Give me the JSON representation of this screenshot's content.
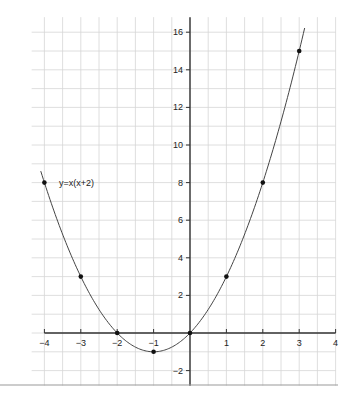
{
  "chart_data": {
    "type": "line",
    "title": "",
    "xlabel": "",
    "ylabel": "",
    "xlim": [
      -4,
      4
    ],
    "ylim": [
      -2.8,
      16.8
    ],
    "grid": true,
    "x_ticks": [
      -4,
      -3,
      -2,
      -1,
      1,
      2,
      3,
      4
    ],
    "x_tick_labels": [
      "−4",
      "−3",
      "−2",
      "−1",
      "1",
      "2",
      "3",
      "4"
    ],
    "y_ticks": [
      -2,
      2,
      4,
      6,
      8,
      10,
      12,
      14,
      16
    ],
    "y_tick_labels": [
      "−2",
      "2",
      "4",
      "6",
      "8",
      "10",
      "12",
      "14",
      "16"
    ],
    "series": [
      {
        "name": "y=x(x+2)",
        "function": "x*(x+2)",
        "curve_x_range": [
          -4.1,
          3.15
        ],
        "points": [
          {
            "x": -4,
            "y": 8
          },
          {
            "x": -3,
            "y": 3
          },
          {
            "x": -2,
            "y": 0
          },
          {
            "x": -1,
            "y": -1
          },
          {
            "x": 0,
            "y": 0
          },
          {
            "x": 1,
            "y": 3
          },
          {
            "x": 2,
            "y": 8
          },
          {
            "x": 3,
            "y": 15
          }
        ]
      }
    ],
    "annotations": [
      {
        "text": "y=x(x+2)",
        "x": -3.6,
        "y": 8
      }
    ],
    "colors": {
      "grid": "#d6d6d6",
      "axis": "#333333",
      "curve": "#444444",
      "points": "#111111",
      "separator": "#999999"
    }
  }
}
